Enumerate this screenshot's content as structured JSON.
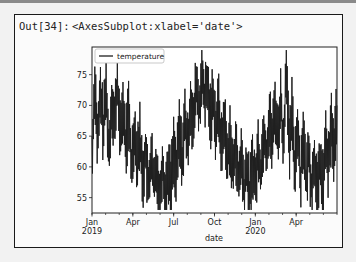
{
  "cell": {
    "prompt": "Out[34]:",
    "repr": "<AxesSubplot:xlabel='date'>"
  },
  "chart_data": {
    "type": "line",
    "title": "",
    "xlabel": "date",
    "ylabel": "",
    "legend": [
      "temperature"
    ],
    "legend_position": "upper left",
    "grid": false,
    "ylim": [
      52.5,
      79.5
    ],
    "xlim": [
      "2019-01-01",
      "2020-06-30"
    ],
    "yticks": [
      55,
      60,
      65,
      70,
      75
    ],
    "xticks": [
      {
        "label": "Jan",
        "sublabel": "2019",
        "month_index": 0
      },
      {
        "label": "Apr",
        "sublabel": "",
        "month_index": 3
      },
      {
        "label": "Jul",
        "sublabel": "",
        "month_index": 6
      },
      {
        "label": "Oct",
        "sublabel": "",
        "month_index": 9
      },
      {
        "label": "Jan",
        "sublabel": "2020",
        "month_index": 12
      },
      {
        "label": "Apr",
        "sublabel": "",
        "month_index": 15
      }
    ],
    "minor_ticks_months": 18,
    "line_color": "#1f1f1f",
    "series": [
      {
        "name": "temperature",
        "frequency": "weekly (approx. of daily series)",
        "start": "2019-01-01",
        "values": [
          61,
          74,
          64,
          72,
          66,
          73,
          62,
          71,
          67,
          74,
          65,
          70,
          63,
          69,
          60,
          66,
          62,
          65,
          58,
          63,
          56,
          62,
          57,
          60,
          54,
          61,
          55,
          60,
          57,
          63,
          59,
          66,
          61,
          68,
          63,
          71,
          66,
          74,
          69,
          75,
          71,
          73,
          68,
          72,
          66,
          70,
          63,
          68,
          61,
          65,
          59,
          64,
          57,
          62,
          56,
          60,
          55,
          61,
          57,
          63,
          59,
          66,
          62,
          68,
          64,
          70,
          65,
          71,
          63,
          78,
          62,
          69,
          60,
          67,
          58,
          66,
          57,
          63,
          56,
          62,
          55,
          61,
          57,
          64,
          60,
          67,
          62,
          70
        ]
      }
    ]
  }
}
